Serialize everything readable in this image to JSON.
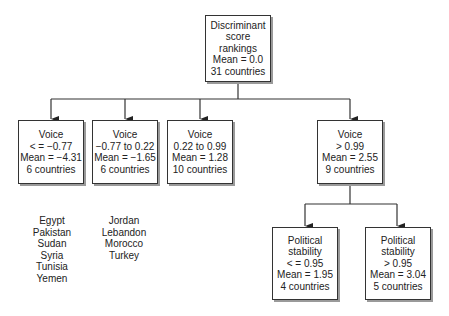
{
  "diagram": {
    "root": {
      "lines": [
        "Discriminant",
        "score",
        "rankings",
        "Mean = 0.0",
        "31 countries"
      ]
    },
    "level1": [
      {
        "lines": [
          "Voice",
          "< = −0.77",
          "Mean = −4.31",
          "6 countries"
        ],
        "countries": [
          "Egypt",
          "Pakistan",
          "Sudan",
          "Syria",
          "Tunisia",
          "Yemen"
        ]
      },
      {
        "lines": [
          "Voice",
          "−0.77 to 0.22",
          "Mean = −1.65",
          "6 countries"
        ],
        "countries": [
          "Jordan",
          "Lebandon",
          "Morocco",
          "Turkey"
        ]
      },
      {
        "lines": [
          "Voice",
          "0.22 to 0.99",
          "Mean = 1.28",
          "10 countries"
        ]
      },
      {
        "lines": [
          "Voice",
          "> 0.99",
          "Mean = 2.55",
          "9 countries"
        ]
      }
    ],
    "level2": [
      {
        "lines": [
          "Political",
          "stability",
          "< = 0.95",
          "Mean = 1.95",
          "4 countries"
        ]
      },
      {
        "lines": [
          "Political",
          "stability",
          "> 0.95",
          "Mean = 3.04",
          "5 countries"
        ]
      }
    ],
    "colors": {
      "line": "#333333",
      "shadow": "#9a9a9a",
      "text": "#222222"
    }
  }
}
